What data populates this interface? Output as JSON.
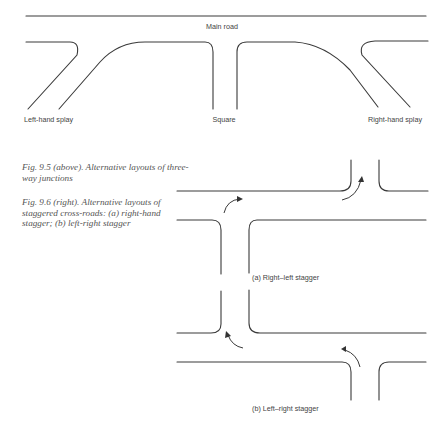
{
  "header": {
    "running_head": "…"
  },
  "figure_9_5": {
    "main_road_label": "Main road",
    "junctions": [
      {
        "id": "left-hand-splay",
        "label": "Left-hand splay"
      },
      {
        "id": "square",
        "label": "Square"
      },
      {
        "id": "right-hand-splay",
        "label": "Right-hand splay"
      }
    ],
    "caption": "Fig. 9.5 (above). Alternative layouts of three-way junctions"
  },
  "figure_9_6": {
    "caption": "Fig. 9.6 (right). Alternative layouts of staggered cross-roads: (a) right-hand stagger; (b) left-right stagger",
    "panels": [
      {
        "id": "a",
        "label": "(a) Right–left stagger"
      },
      {
        "id": "b",
        "label": "(b) Left–right stagger"
      }
    ]
  }
}
